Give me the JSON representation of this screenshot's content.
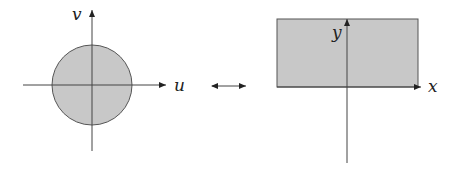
{
  "diagram": {
    "left_figure": {
      "shape": "disk",
      "shape_color": "#c8c8c8",
      "horizontal_axis_label": "u",
      "vertical_axis_label": "v"
    },
    "connector": {
      "type": "double-arrow",
      "meaning": "correspondence"
    },
    "right_figure": {
      "shape": "rectangle",
      "shape_color": "#c8c8c8",
      "horizontal_axis_label": "x",
      "vertical_axis_label": "y"
    }
  }
}
